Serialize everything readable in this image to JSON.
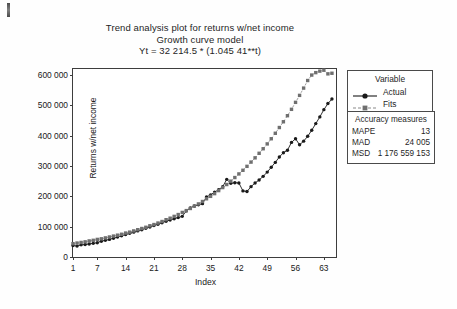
{
  "titles": {
    "line1": "Trend analysis plot for returns w/net income",
    "line2": "Growth curve model",
    "line3": "Yt = 32 214.5 * (1.045 41**t)"
  },
  "legend": {
    "title": "Variable",
    "items": [
      {
        "label": "Actual",
        "marker": "circle",
        "style": "solid",
        "color": "#1a1a1a"
      },
      {
        "label": "Fits",
        "marker": "square",
        "style": "dashed",
        "color": "#8a8a8a"
      }
    ]
  },
  "accuracy": {
    "title": "Accuracy measures",
    "rows": [
      {
        "key": "MAPE",
        "value": "13"
      },
      {
        "key": "MAD",
        "value": "24 005"
      },
      {
        "key": "MSD",
        "value": "1 176 559 153"
      }
    ]
  },
  "chart_data": {
    "type": "line",
    "title": "Trend analysis plot for returns w/net income",
    "subtitle": "Growth curve model",
    "equation": "Yt = 32 214.5 * (1.045 41**t)",
    "xlabel": "Index",
    "ylabel": "Returns w/net income",
    "grid": false,
    "legend_position": "right",
    "xlim": [
      1,
      66
    ],
    "ylim": [
      0,
      620000
    ],
    "yticks": [
      0,
      100000,
      200000,
      300000,
      400000,
      500000,
      600000
    ],
    "ytick_labels": [
      "0",
      "100 000",
      "200 000",
      "300 000",
      "400 000",
      "500 000",
      "600 000"
    ],
    "xticks": [
      1,
      7,
      14,
      21,
      28,
      35,
      42,
      49,
      56,
      63
    ],
    "x": [
      1,
      2,
      3,
      4,
      5,
      6,
      7,
      8,
      9,
      10,
      11,
      12,
      13,
      14,
      15,
      16,
      17,
      18,
      19,
      20,
      21,
      22,
      23,
      24,
      25,
      26,
      27,
      28,
      29,
      30,
      31,
      32,
      33,
      34,
      35,
      36,
      37,
      38,
      39,
      40,
      41,
      42,
      43,
      44,
      45,
      46,
      47,
      48,
      49,
      50,
      51,
      52,
      53,
      54,
      55,
      56,
      57,
      58,
      59,
      60,
      61,
      62,
      63,
      64,
      65
    ],
    "series": [
      {
        "name": "Actual",
        "marker": "circle",
        "style": "solid",
        "color": "#1a1a1a",
        "values": [
          38000,
          36000,
          40000,
          41000,
          43000,
          45000,
          47000,
          52000,
          55000,
          58000,
          62000,
          66000,
          70000,
          74000,
          78000,
          82000,
          86000,
          90000,
          95000,
          99000,
          104000,
          108000,
          113000,
          118000,
          122000,
          126000,
          130000,
          134000,
          152000,
          162000,
          168000,
          172000,
          176000,
          198000,
          205000,
          214000,
          222000,
          232000,
          256000,
          243000,
          245000,
          244000,
          218000,
          216000,
          232000,
          244000,
          254000,
          266000,
          280000,
          296000,
          312000,
          330000,
          344000,
          352000,
          378000,
          390000,
          370000,
          382000,
          398000,
          418000,
          440000,
          462000,
          486000,
          506000,
          521000
        ]
      },
      {
        "name": "Fits",
        "marker": "square",
        "style": "dashed",
        "color": "#8a8a8a",
        "values": [
          44000,
          46000,
          48000,
          50000,
          53000,
          55000,
          58000,
          60000,
          63000,
          66000,
          69000,
          72000,
          75000,
          79000,
          82000,
          86000,
          90000,
          94000,
          98000,
          103000,
          107000,
          112000,
          117000,
          123000,
          128000,
          134000,
          140000,
          147000,
          153000,
          160000,
          168000,
          175000,
          183000,
          192000,
          200000,
          209000,
          219000,
          229000,
          239000,
          250000,
          262000,
          274000,
          286000,
          299000,
          313000,
          327000,
          342000,
          357000,
          373000,
          390000,
          408000,
          427000,
          446000,
          466000,
          487000,
          510000,
          533000,
          557000,
          582000,
          600000,
          608000,
          613000,
          616000,
          604000,
          606000
        ]
      }
    ]
  }
}
